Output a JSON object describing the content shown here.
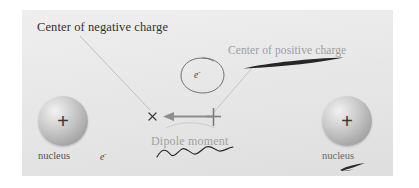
{
  "figure": {
    "background_color": "#e7e7e7",
    "page_color": "#ffffff"
  },
  "labels": {
    "center_of_negative_charge": "Center of negative charge",
    "center_of_positive_charge": "Center of positive charge",
    "dipole_moment": "Dipole moment",
    "nucleus_left": "nucleus",
    "nucleus_right": "nucleus",
    "electron_free": "e",
    "electron_free_sup": "-",
    "electron_orbit": "e",
    "electron_orbit_sup": "-"
  },
  "symbols": {
    "nucleus_charge_left": "+",
    "nucleus_charge_right": "+",
    "negative_charge_marker": "×",
    "positive_charge_marker": "+"
  },
  "colors": {
    "label_dark": "#34302f",
    "label_gray": "#9e9e9e",
    "arrow_gray": "#8d8d8d",
    "leader_line": "#b9b9b9",
    "ink_dark": "#2a2a2a",
    "sphere_highlight": "#f2f2f2",
    "sphere_shadow": "#9a9a9a"
  },
  "annotations": {
    "dipole_arrow_direction": "left",
    "dipole_arrow_from": "center of positive charge",
    "dipole_arrow_to": "center of negative charge",
    "leader_from_negative_label": "Center of negative charge → × marker",
    "leader_from_positive_label": "Center of positive charge → + marker",
    "handdrawn_marks": [
      "underline sliver beneath positive charge label",
      "wavy squiggle beneath dipole moment label",
      "small arrow sliver beneath right nucleus label"
    ]
  }
}
